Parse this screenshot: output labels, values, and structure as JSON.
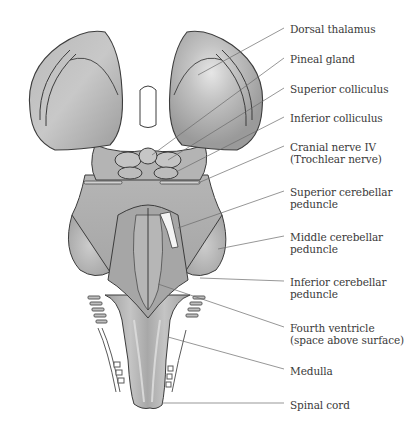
{
  "figure": {
    "labels": [
      {
        "id": "dorsal-thalamus",
        "lines": [
          "Dorsal thalamus"
        ],
        "x": 290,
        "y": 23
      },
      {
        "id": "pineal-gland",
        "lines": [
          "Pineal gland"
        ],
        "x": 290,
        "y": 53
      },
      {
        "id": "superior-colliculus",
        "lines": [
          "Superior colliculus"
        ],
        "x": 290,
        "y": 83
      },
      {
        "id": "inferior-colliculus",
        "lines": [
          "Inferior colliculus"
        ],
        "x": 290,
        "y": 112
      },
      {
        "id": "cranial-nerve-iv",
        "lines": [
          "Cranial nerve IV",
          "(Trochlear nerve)"
        ],
        "x": 290,
        "y": 141
      },
      {
        "id": "superior-cerebellar-peduncle",
        "lines": [
          "Superior cerebellar",
          "peduncle"
        ],
        "x": 290,
        "y": 186
      },
      {
        "id": "middle-cerebellar-peduncle",
        "lines": [
          "Middle cerebellar",
          "peduncle"
        ],
        "x": 290,
        "y": 231
      },
      {
        "id": "inferior-cerebellar-peduncle",
        "lines": [
          "Inferior cerebellar",
          "peduncle"
        ],
        "x": 290,
        "y": 276
      },
      {
        "id": "fourth-ventricle",
        "lines": [
          "Fourth ventricle",
          "(space above surface)"
        ],
        "x": 290,
        "y": 322
      },
      {
        "id": "medulla",
        "lines": [
          "Medulla"
        ],
        "x": 290,
        "y": 365
      },
      {
        "id": "spinal-cord",
        "lines": [
          "Spinal cord"
        ],
        "x": 290,
        "y": 399
      }
    ],
    "colors": {
      "background": "#ffffff",
      "tissue_light": "#c9c9c9",
      "tissue_mid": "#a9a9a9",
      "tissue_dark": "#8a8a8a",
      "outline": "#3c3c3c",
      "leader_line": "#6a6a6a",
      "text": "#3a3a3a"
    }
  }
}
